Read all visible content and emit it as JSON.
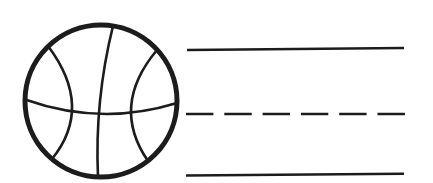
{
  "worksheet": {
    "background_color": "#ffffff",
    "ink_color": "#1c1c1c",
    "illustration": {
      "name": "basketball",
      "style": "black outline line-art",
      "seams": [
        "vertical",
        "horizontal",
        "left-panel",
        "right-panel"
      ]
    },
    "writing_lines": {
      "color": "#1c1c1c",
      "top": {
        "style": "solid"
      },
      "middle": {
        "style": "dashed",
        "dash_pattern": "27.4 10.9"
      },
      "bottom": {
        "style": "solid"
      }
    }
  }
}
